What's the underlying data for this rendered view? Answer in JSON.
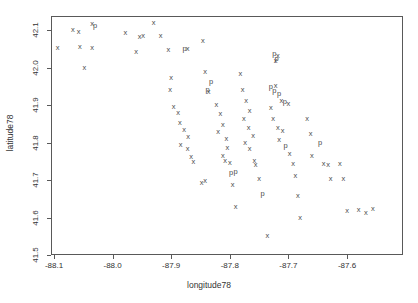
{
  "chart_data": {
    "type": "scatter",
    "title": "",
    "xlabel": "longitude78",
    "ylabel": "latitude78",
    "xlim": [
      -88.13,
      -88.13
    ],
    "ylim": [
      41.47,
      42.15
    ],
    "grid": false,
    "legend": "none",
    "xticks": [
      "-88.1",
      "-88.0",
      "-87.9",
      "-87.8",
      "-87.7",
      "-87.6"
    ],
    "xtickvalues": [
      -88.1,
      -88.0,
      -87.9,
      -87.8,
      -87.7,
      -87.6
    ],
    "yticks": [
      "41.5",
      "41.6",
      "41.7",
      "41.8",
      "41.9",
      "42.0",
      "42.1"
    ],
    "ytickvalues": [
      41.5,
      41.6,
      41.7,
      41.8,
      41.9,
      42.0,
      42.1
    ],
    "marker_labels": [
      "x",
      "p"
    ],
    "marker_color": "#4d4d4d",
    "frame_color": "#595959",
    "points": [
      {
        "x": -88.068,
        "y": 42.1,
        "m": "x"
      },
      {
        "x": -88.058,
        "y": 42.095,
        "m": "x"
      },
      {
        "x": -88.035,
        "y": 42.115,
        "m": "x"
      },
      {
        "x": -88.03,
        "y": 42.112,
        "m": "p"
      },
      {
        "x": -88.094,
        "y": 42.053,
        "m": "x"
      },
      {
        "x": -88.056,
        "y": 42.055,
        "m": "x"
      },
      {
        "x": -88.035,
        "y": 42.053,
        "m": "x"
      },
      {
        "x": -88.048,
        "y": 41.998,
        "m": "x"
      },
      {
        "x": -87.978,
        "y": 42.093,
        "m": "x"
      },
      {
        "x": -87.954,
        "y": 42.082,
        "m": "x"
      },
      {
        "x": -87.948,
        "y": 42.083,
        "m": "x"
      },
      {
        "x": -87.96,
        "y": 42.042,
        "m": "x"
      },
      {
        "x": -87.93,
        "y": 42.12,
        "m": "x"
      },
      {
        "x": -87.918,
        "y": 42.084,
        "m": "x"
      },
      {
        "x": -87.905,
        "y": 42.048,
        "m": "x"
      },
      {
        "x": -87.877,
        "y": 42.05,
        "m": "p"
      },
      {
        "x": -87.872,
        "y": 42.05,
        "m": "x"
      },
      {
        "x": -87.9,
        "y": 41.972,
        "m": "x"
      },
      {
        "x": -87.902,
        "y": 41.94,
        "m": "x"
      },
      {
        "x": -87.896,
        "y": 41.894,
        "m": "x"
      },
      {
        "x": -87.888,
        "y": 41.878,
        "m": "x"
      },
      {
        "x": -87.885,
        "y": 41.853,
        "m": "x"
      },
      {
        "x": -87.878,
        "y": 41.833,
        "m": "x"
      },
      {
        "x": -87.871,
        "y": 41.816,
        "m": "x"
      },
      {
        "x": -87.884,
        "y": 41.794,
        "m": "x"
      },
      {
        "x": -87.872,
        "y": 41.782,
        "m": "x"
      },
      {
        "x": -87.866,
        "y": 41.762,
        "m": "x"
      },
      {
        "x": -87.862,
        "y": 41.748,
        "m": "x"
      },
      {
        "x": -87.846,
        "y": 42.07,
        "m": "x"
      },
      {
        "x": -87.842,
        "y": 41.988,
        "m": "x"
      },
      {
        "x": -87.832,
        "y": 41.962,
        "m": "p"
      },
      {
        "x": -87.838,
        "y": 41.94,
        "m": "p"
      },
      {
        "x": -87.836,
        "y": 41.935,
        "m": "x"
      },
      {
        "x": -87.823,
        "y": 41.9,
        "m": "x"
      },
      {
        "x": -87.816,
        "y": 41.875,
        "m": "x"
      },
      {
        "x": -87.812,
        "y": 41.848,
        "m": "x"
      },
      {
        "x": -87.82,
        "y": 41.828,
        "m": "x"
      },
      {
        "x": -87.806,
        "y": 41.81,
        "m": "x"
      },
      {
        "x": -87.804,
        "y": 41.786,
        "m": "x"
      },
      {
        "x": -87.812,
        "y": 41.765,
        "m": "x"
      },
      {
        "x": -87.808,
        "y": 41.752,
        "m": "x"
      },
      {
        "x": -87.8,
        "y": 41.745,
        "m": "x"
      },
      {
        "x": -87.798,
        "y": 41.718,
        "m": "p"
      },
      {
        "x": -87.79,
        "y": 41.722,
        "m": "p"
      },
      {
        "x": -87.795,
        "y": 41.688,
        "m": "x"
      },
      {
        "x": -87.842,
        "y": 41.698,
        "m": "x"
      },
      {
        "x": -87.848,
        "y": 41.692,
        "m": "x"
      },
      {
        "x": -87.79,
        "y": 41.628,
        "m": "x"
      },
      {
        "x": -87.782,
        "y": 41.982,
        "m": "x"
      },
      {
        "x": -87.778,
        "y": 41.94,
        "m": "x"
      },
      {
        "x": -87.772,
        "y": 41.91,
        "m": "x"
      },
      {
        "x": -87.766,
        "y": 41.885,
        "m": "x"
      },
      {
        "x": -87.776,
        "y": 41.862,
        "m": "x"
      },
      {
        "x": -87.768,
        "y": 41.838,
        "m": "x"
      },
      {
        "x": -87.76,
        "y": 41.818,
        "m": "x"
      },
      {
        "x": -87.774,
        "y": 41.8,
        "m": "x"
      },
      {
        "x": -87.766,
        "y": 41.782,
        "m": "x"
      },
      {
        "x": -87.758,
        "y": 41.752,
        "m": "x"
      },
      {
        "x": -87.756,
        "y": 41.74,
        "m": "x"
      },
      {
        "x": -87.75,
        "y": 41.702,
        "m": "x"
      },
      {
        "x": -87.744,
        "y": 41.662,
        "m": "p"
      },
      {
        "x": -87.736,
        "y": 41.552,
        "m": "x"
      },
      {
        "x": -87.724,
        "y": 42.035,
        "m": "p"
      },
      {
        "x": -87.718,
        "y": 42.03,
        "m": "x"
      },
      {
        "x": -87.72,
        "y": 42.022,
        "m": "p"
      },
      {
        "x": -87.722,
        "y": 42.018,
        "m": "x"
      },
      {
        "x": -87.73,
        "y": 41.948,
        "m": "p"
      },
      {
        "x": -87.722,
        "y": 41.952,
        "m": "x"
      },
      {
        "x": -87.724,
        "y": 41.938,
        "m": "p"
      },
      {
        "x": -87.716,
        "y": 41.93,
        "m": "p"
      },
      {
        "x": -87.712,
        "y": 41.912,
        "m": "x"
      },
      {
        "x": -87.706,
        "y": 41.908,
        "m": "p"
      },
      {
        "x": -87.7,
        "y": 41.902,
        "m": "x"
      },
      {
        "x": -87.73,
        "y": 41.892,
        "m": "x"
      },
      {
        "x": -87.726,
        "y": 41.862,
        "m": "x"
      },
      {
        "x": -87.718,
        "y": 41.838,
        "m": "x"
      },
      {
        "x": -87.71,
        "y": 41.83,
        "m": "x"
      },
      {
        "x": -87.716,
        "y": 41.808,
        "m": "x"
      },
      {
        "x": -87.705,
        "y": 41.792,
        "m": "p"
      },
      {
        "x": -87.698,
        "y": 41.77,
        "m": "x"
      },
      {
        "x": -87.692,
        "y": 41.742,
        "m": "x"
      },
      {
        "x": -87.688,
        "y": 41.712,
        "m": "x"
      },
      {
        "x": -87.684,
        "y": 41.658,
        "m": "x"
      },
      {
        "x": -87.68,
        "y": 41.6,
        "m": "x"
      },
      {
        "x": -87.668,
        "y": 41.862,
        "m": "x"
      },
      {
        "x": -87.662,
        "y": 41.822,
        "m": "x"
      },
      {
        "x": -87.66,
        "y": 41.765,
        "m": "x"
      },
      {
        "x": -87.646,
        "y": 41.798,
        "m": "p"
      },
      {
        "x": -87.64,
        "y": 41.742,
        "m": "x"
      },
      {
        "x": -87.632,
        "y": 41.74,
        "m": "x"
      },
      {
        "x": -87.628,
        "y": 41.702,
        "m": "x"
      },
      {
        "x": -87.612,
        "y": 41.742,
        "m": "x"
      },
      {
        "x": -87.606,
        "y": 41.702,
        "m": "x"
      },
      {
        "x": -87.6,
        "y": 41.618,
        "m": "x"
      },
      {
        "x": -87.58,
        "y": 41.62,
        "m": "x"
      },
      {
        "x": -87.568,
        "y": 41.612,
        "m": "x"
      },
      {
        "x": -87.556,
        "y": 41.622,
        "m": "x"
      }
    ]
  }
}
